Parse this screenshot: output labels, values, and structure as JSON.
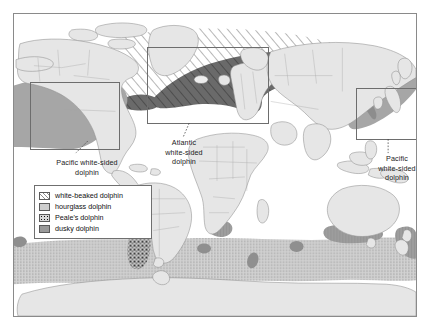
{
  "figure": {
    "type": "distribution-map",
    "projection": "world-equirectangular",
    "background_color": "#ffffff",
    "frame_color": "#8a8a8a",
    "land_color": "#e6e6e6",
    "land_outline_color": "#8f8f8f"
  },
  "legend": {
    "title": "",
    "border_color": "#6f6f6f",
    "items": [
      {
        "label": "white-beaked dolphin",
        "pattern": "diagonal-hatch",
        "color": "#8d8d8d",
        "swatch_class": "sw-wb"
      },
      {
        "label": "hourglass dolphin",
        "pattern": "stipple",
        "color": "#cdcdcd",
        "swatch_class": "sw-hg"
      },
      {
        "label": "Peale's dolphin",
        "pattern": "coarse-speckle",
        "color": "#111111",
        "swatch_class": "sw-pe"
      },
      {
        "label": "dusky dolphin",
        "pattern": "solid-gray",
        "color": "#9a9a9a",
        "swatch_class": "sw-du"
      }
    ]
  },
  "callouts": [
    {
      "name": "pacific-white-sided-west",
      "text": "Pacific white-sided\ndolphin",
      "left": 27,
      "top": 144,
      "width": 92
    },
    {
      "name": "atlantic-white-sided",
      "text": "Atlantic\nwhite-sided\ndolphin",
      "left": 142,
      "top": 124,
      "width": 56
    },
    {
      "name": "pacific-white-sided-east",
      "text": "Pacific\nwhite-sided\ndolphin",
      "left": 355,
      "top": 140,
      "width": 56
    }
  ],
  "inset_boxes": [
    {
      "name": "inset-north-east-pacific",
      "left": 16,
      "top": 68,
      "width": 90,
      "height": 68
    },
    {
      "name": "inset-north-atlantic",
      "left": 133,
      "top": 33,
      "width": 122,
      "height": 77
    },
    {
      "name": "inset-north-west-pacific",
      "left": 342,
      "top": 74,
      "width": 70,
      "height": 52
    }
  ],
  "ranges": [
    {
      "species": "white-beaked dolphin",
      "region": "North Atlantic / subarctic",
      "fill": "diagonal-hatch"
    },
    {
      "species": "Atlantic white-sided dolphin",
      "region": "North Atlantic",
      "fill": "dark-solid"
    },
    {
      "species": "Pacific white-sided dolphin",
      "region": "North Pacific rim (east and west)",
      "fill": "medium-gray"
    },
    {
      "species": "hourglass dolphin",
      "region": "Circumpolar Southern Ocean band",
      "fill": "stipple"
    },
    {
      "species": "Peale's dolphin",
      "region": "Southern South America / Tierra del Fuego",
      "fill": "coarse-speckle"
    },
    {
      "species": "dusky dolphin",
      "region": "Southern Africa, southern Australia, New Zealand, South America",
      "fill": "dark-gray"
    }
  ]
}
